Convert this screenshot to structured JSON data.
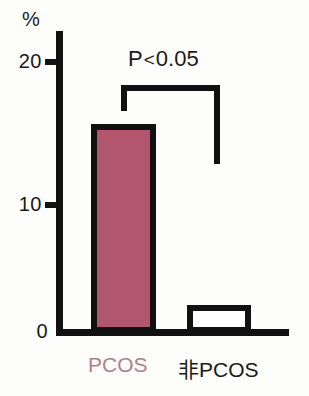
{
  "chart_data": {
    "type": "bar",
    "title": "",
    "subtitle": "",
    "xlabel": "",
    "ylabel": "%",
    "categories": [
      "PCOS",
      "非PCOS"
    ],
    "values": [
      15,
      2
    ],
    "series": [
      {
        "name": "prevalence",
        "values": [
          15,
          2
        ]
      }
    ],
    "ylim": [
      0,
      22
    ],
    "yticks": [
      0,
      10,
      20
    ],
    "ytick_labels": [
      "0",
      "10",
      "20"
    ],
    "grid": false,
    "legend": null,
    "annotations": [
      {
        "name": "significance-bracket",
        "text": "P<0.05",
        "text_parts": {
          "prefix": "P",
          "operator": "<",
          "value": "0.05"
        },
        "connects": [
          "PCOS",
          "非PCOS"
        ]
      }
    ],
    "bar_colors": [
      "#b2566e",
      "#ffffff"
    ],
    "bar_edge_color": "#111111",
    "category_label_colors": [
      "#b08088",
      "#1a1a1a"
    ]
  },
  "axis": {
    "unit_label": "%",
    "tick_20": "20",
    "tick_10": "10",
    "tick_0": "0"
  },
  "annotation": {
    "p_prefix": "P",
    "p_operator": "<",
    "p_value": "0.05"
  },
  "categories": {
    "first": "PCOS",
    "second": "非PCOS"
  }
}
